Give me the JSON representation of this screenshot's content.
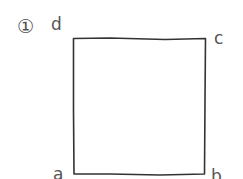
{
  "figure": {
    "number_label": "①",
    "shape": "square",
    "vertices": [
      {
        "name": "a",
        "label": "a",
        "position": "bottom-left"
      },
      {
        "name": "b",
        "label": "b",
        "position": "bottom-right"
      },
      {
        "name": "c",
        "label": "c",
        "position": "top-right"
      },
      {
        "name": "d",
        "label": "d",
        "position": "top-left"
      }
    ],
    "stroke_color": "#333333",
    "label_color": "#555555"
  }
}
